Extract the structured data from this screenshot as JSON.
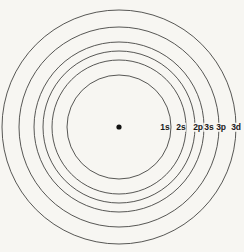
{
  "figure": {
    "background_color": "#f7f6f2",
    "line_color": "#3a3a38",
    "nucleus_color": "#111111",
    "width": 244,
    "height": 252
  },
  "nucleus": {
    "label": "nucleus",
    "cx": 119,
    "cy": 127,
    "r": 2.6
  },
  "chart_data": {
    "type": "scatter",
    "subtitle": "Concentric circles representing electron orbital energy levels",
    "xlabel": "",
    "ylabel": "",
    "center": [
      119,
      127
    ],
    "grid": false,
    "legend_position": "inline-right",
    "categories": [
      "1s",
      "2s",
      "2p",
      "3s",
      "3p",
      "3d"
    ],
    "values": [
      52,
      67,
      76,
      85,
      100,
      117
    ],
    "series": [
      {
        "name": "orbital radius (px)",
        "values": [
          52,
          67,
          76,
          85,
          100,
          117
        ]
      }
    ],
    "annotations": [
      {
        "text": "1s",
        "x": 165,
        "y": 127
      },
      {
        "text": "2s",
        "x": 181,
        "y": 127
      },
      {
        "text": "2p",
        "x": 198,
        "y": 127
      },
      {
        "text": "3s",
        "x": 209,
        "y": 127
      },
      {
        "text": "3p",
        "x": 221,
        "y": 127
      },
      {
        "text": "3d",
        "x": 236,
        "y": 127
      }
    ]
  },
  "shells": [
    {
      "id": "shell-1s",
      "label": "1s",
      "radius": 52,
      "label_x": 165,
      "label_y": 127
    },
    {
      "id": "shell-2s",
      "label": "2s",
      "radius": 67,
      "label_x": 181,
      "label_y": 127
    },
    {
      "id": "shell-2p",
      "label": "2p",
      "radius": 76,
      "label_x": 198,
      "label_y": 127
    },
    {
      "id": "shell-3s",
      "label": "3s",
      "radius": 85,
      "label_x": 209,
      "label_y": 127
    },
    {
      "id": "shell-3p",
      "label": "3p",
      "radius": 100,
      "label_x": 221,
      "label_y": 127
    },
    {
      "id": "shell-3d",
      "label": "3d",
      "radius": 117,
      "label_x": 236,
      "label_y": 127
    }
  ]
}
